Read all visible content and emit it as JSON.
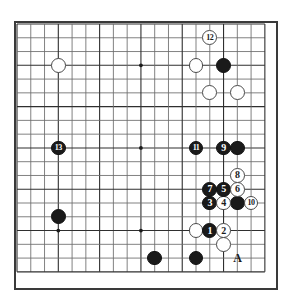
{
  "diagram": {
    "type": "go-board-diagram",
    "board_size": 19,
    "visible_region": {
      "columns": 19,
      "rows": 19,
      "note": "full board frame shown"
    },
    "geometry": {
      "origin_x": 17,
      "origin_y": 24,
      "spacing": 13.77,
      "frame_left": 14,
      "frame_top": 21,
      "frame_width": 264,
      "frame_height": 269
    },
    "colors": {
      "board_background": "#ffffff",
      "grid_line": "#6b6b6b",
      "grid_line_major": "#2f2f2f",
      "frame_border": "#3a3a3a",
      "black_stone": "#1a1a1a",
      "white_stone": "#ffffff",
      "white_stone_border": "#4a4a4a",
      "label_on_black": "#ffffff",
      "label_on_white": "#1a1a1a"
    },
    "star_points": [
      {
        "col": 3,
        "row": 3
      },
      {
        "col": 9,
        "row": 3
      },
      {
        "col": 15,
        "row": 3
      },
      {
        "col": 3,
        "row": 9
      },
      {
        "col": 9,
        "row": 9
      },
      {
        "col": 15,
        "row": 9
      },
      {
        "col": 3,
        "row": 15
      },
      {
        "col": 9,
        "row": 15
      },
      {
        "col": 15,
        "row": 15
      }
    ],
    "stones": [
      {
        "id": "w-upper-left",
        "color": "white",
        "col": 3,
        "row": 3,
        "label": ""
      },
      {
        "id": "w-upper-right-a",
        "color": "white",
        "col": 13,
        "row": 3,
        "label": ""
      },
      {
        "id": "b-upper-right-a",
        "color": "black",
        "col": 15,
        "row": 3,
        "label": ""
      },
      {
        "id": "w-upper-right-b",
        "color": "white",
        "col": 14,
        "row": 5,
        "label": ""
      },
      {
        "id": "w-upper-right-c",
        "color": "white",
        "col": 16,
        "row": 5,
        "label": ""
      },
      {
        "id": "b-left-side",
        "color": "black",
        "col": 3,
        "row": 14,
        "label": ""
      },
      {
        "id": "b-lower-left",
        "color": "black",
        "col": 10,
        "row": 17,
        "label": ""
      },
      {
        "id": "b-lower-mid",
        "color": "black",
        "col": 13,
        "row": 17,
        "label": ""
      },
      {
        "id": "w-right-lower-a",
        "color": "white",
        "col": 13,
        "row": 15,
        "label": ""
      },
      {
        "id": "w-right-lower-b",
        "color": "white",
        "col": 15,
        "row": 16,
        "label": ""
      },
      {
        "id": "b-right-group-a",
        "color": "black",
        "col": 16,
        "row": 9,
        "label": ""
      },
      {
        "id": "b-right-group-b",
        "color": "black",
        "col": 16,
        "row": 13,
        "label": ""
      },
      {
        "id": "m1",
        "color": "black",
        "col": 14,
        "row": 15,
        "label": "1"
      },
      {
        "id": "m2",
        "color": "white",
        "col": 15,
        "row": 15,
        "label": "2"
      },
      {
        "id": "m3",
        "color": "black",
        "col": 14,
        "row": 13,
        "label": "3"
      },
      {
        "id": "m4",
        "color": "white",
        "col": 15,
        "row": 13,
        "label": "4"
      },
      {
        "id": "m5",
        "color": "black",
        "col": 15,
        "row": 12,
        "label": "5"
      },
      {
        "id": "m6",
        "color": "white",
        "col": 16,
        "row": 12,
        "label": "6"
      },
      {
        "id": "m7",
        "color": "black",
        "col": 14,
        "row": 12,
        "label": "7"
      },
      {
        "id": "m8",
        "color": "white",
        "col": 16,
        "row": 11,
        "label": "8"
      },
      {
        "id": "m9",
        "color": "black",
        "col": 15,
        "row": 9,
        "label": "9"
      },
      {
        "id": "m10",
        "color": "white",
        "col": 17,
        "row": 13,
        "label": "10"
      },
      {
        "id": "m11",
        "color": "black",
        "col": 13,
        "row": 9,
        "label": "11"
      },
      {
        "id": "m12",
        "color": "white",
        "col": 14,
        "row": 1,
        "label": "12"
      },
      {
        "id": "m13",
        "color": "black",
        "col": 3,
        "row": 9,
        "label": "13"
      }
    ],
    "plain_labels": [
      {
        "id": "label-a",
        "text": "A",
        "col": 16,
        "row": 17
      }
    ]
  }
}
